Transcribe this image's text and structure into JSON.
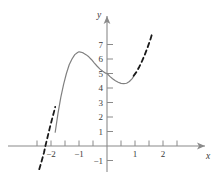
{
  "chart_data": {
    "type": "line",
    "title": "",
    "xlabel": "x",
    "ylabel": "y",
    "xlim": [
      -2.45,
      2.6
    ],
    "ylim": [
      -1.6,
      7.9
    ],
    "grid": false,
    "legend": null,
    "x_ticks": [
      -2,
      -1,
      1,
      2
    ],
    "x_tick_labels": [
      "−2",
      "−1",
      "1",
      "2"
    ],
    "x_minor_ticks": [
      -2.5,
      -1.5,
      -0.5,
      0.5,
      1.5,
      2.5
    ],
    "y_ticks": [
      -1,
      1,
      2,
      3,
      4,
      5,
      6,
      7
    ],
    "y_tick_labels": [
      "−1",
      "1",
      "2",
      "3",
      "4",
      "5",
      "6",
      "7"
    ],
    "annotations": {
      "local_maximum": {
        "x": -1.0,
        "y": 6.5
      },
      "y_intercept": {
        "x": 0,
        "y": 5.0
      },
      "local_minimum": {
        "x": 0.6,
        "y": 4.3
      },
      "x_intercept": {
        "x": -2.2,
        "y": 0
      }
    },
    "series": [
      {
        "name": "cubic-solid-segment",
        "style": "solid",
        "color": "#808080",
        "points": [
          [
            -1.85,
            0.95
          ],
          [
            -1.75,
            2.25
          ],
          [
            -1.65,
            3.35
          ],
          [
            -1.55,
            4.25
          ],
          [
            -1.45,
            5.0
          ],
          [
            -1.35,
            5.6
          ],
          [
            -1.25,
            6.0
          ],
          [
            -1.15,
            6.3
          ],
          [
            -1.05,
            6.45
          ],
          [
            -1.0,
            6.5
          ],
          [
            -0.95,
            6.48
          ],
          [
            -0.85,
            6.42
          ],
          [
            -0.75,
            6.3
          ],
          [
            -0.65,
            6.15
          ],
          [
            -0.55,
            5.95
          ],
          [
            -0.45,
            5.72
          ],
          [
            -0.35,
            5.5
          ],
          [
            -0.25,
            5.3
          ],
          [
            -0.15,
            5.15
          ],
          [
            -0.05,
            5.02
          ],
          [
            0.0,
            5.0
          ],
          [
            0.1,
            4.8
          ],
          [
            0.2,
            4.64
          ],
          [
            0.3,
            4.5
          ],
          [
            0.4,
            4.4
          ],
          [
            0.5,
            4.32
          ],
          [
            0.6,
            4.3
          ],
          [
            0.7,
            4.33
          ],
          [
            0.8,
            4.45
          ],
          [
            0.9,
            4.65
          ],
          [
            1.0,
            4.95
          ]
        ]
      },
      {
        "name": "cubic-dashed-left-extension",
        "style": "dashed",
        "color": "#1a1a1a",
        "points": [
          [
            -2.42,
            -1.6
          ],
          [
            -2.35,
            -1.15
          ],
          [
            -2.25,
            -0.45
          ],
          [
            -2.2,
            0.0
          ],
          [
            -2.15,
            0.4
          ],
          [
            -2.05,
            1.2
          ],
          [
            -1.95,
            1.95
          ],
          [
            -1.88,
            2.45
          ],
          [
            -1.85,
            2.7
          ]
        ]
      },
      {
        "name": "cubic-dashed-right-extension",
        "style": "dashed",
        "color": "#1a1a1a",
        "points": [
          [
            0.95,
            4.85
          ],
          [
            1.05,
            5.1
          ],
          [
            1.15,
            5.45
          ],
          [
            1.25,
            5.85
          ],
          [
            1.35,
            6.3
          ],
          [
            1.45,
            6.8
          ],
          [
            1.55,
            7.35
          ],
          [
            1.62,
            7.8
          ]
        ]
      }
    ]
  },
  "axes": {
    "x_axis_name": "x",
    "y_axis_name": "y"
  }
}
